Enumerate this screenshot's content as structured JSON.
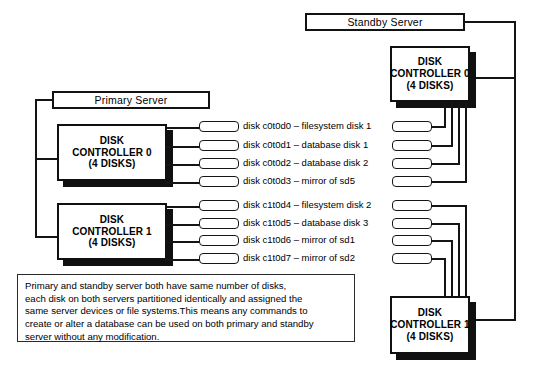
{
  "diagram": {
    "servers": [
      {
        "id": "primary",
        "label": "Primary Server"
      },
      {
        "id": "standby",
        "label": "Standby Server"
      }
    ],
    "controllers": [
      {
        "id": "primary-c0",
        "line1": "DISK",
        "line2": "CONTROLLER 0",
        "line3": "(4 DISKS)"
      },
      {
        "id": "primary-c1",
        "line1": "DISK",
        "line2": "CONTROLLER 1",
        "line3": "(4 DISKS)"
      },
      {
        "id": "standby-c0",
        "line1": "DISK",
        "line2": "CONTROLLER 0",
        "line3": "(4 DISKS)"
      },
      {
        "id": "standby-c1",
        "line1": "DISK",
        "line2": "CONTROLLER 1",
        "line3": "(4 DISKS)"
      }
    ],
    "disk_labels": [
      "disk c0t0d0 – filesystem disk 1",
      "disk c0t0d1 – database disk 1",
      "disk c0t0d2 – database disk 2",
      "disk c0t0d3 – mirror of sd5",
      "disk c1t0d4 – filesystem disk 2",
      "disk c1t0d5 – database disk 3",
      "disk c1t0d6 – mirror of sd1",
      "disk c1t0d7 – mirror of sd2"
    ],
    "note": {
      "lines": [
        "Primary and standby server both have same number of disks,",
        "each disk on both servers partitioned identically and assigned the",
        "same server devices or file systems.This means any commands to",
        "create or alter a database can be used on both primary and standby",
        "server without any modification."
      ]
    },
    "colors": {
      "stroke": "#121212",
      "shadow": "#101010",
      "background": "#ffffff"
    }
  }
}
